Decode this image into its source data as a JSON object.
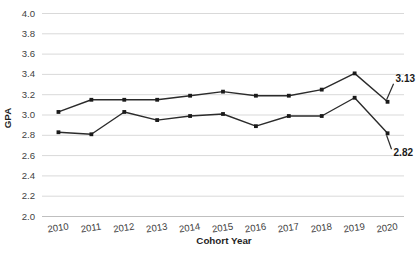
{
  "chart_data": {
    "type": "line",
    "title": "",
    "xlabel": "Cohort Year",
    "ylabel": "GPA",
    "categories": [
      "2010",
      "2011",
      "2012",
      "2013",
      "2014",
      "2015",
      "2016",
      "2017",
      "2018",
      "2019",
      "2020"
    ],
    "ylim": [
      2.0,
      4.0
    ],
    "ytick_labels": [
      "4.0",
      "3.8",
      "3.6",
      "3.4",
      "3.2",
      "3.0",
      "2.8",
      "2.6",
      "2.4",
      "2.2",
      "2.0"
    ],
    "ytick_values": [
      4.0,
      3.8,
      3.6,
      3.4,
      3.2,
      3.0,
      2.8,
      2.6,
      2.4,
      2.2,
      2.0
    ],
    "grid": true,
    "legend": "none",
    "series": [
      {
        "name": "upper-series",
        "values": [
          3.03,
          3.15,
          3.15,
          3.15,
          3.19,
          3.23,
          3.19,
          3.19,
          3.25,
          3.41,
          3.13
        ]
      },
      {
        "name": "lower-series",
        "values": [
          2.83,
          2.81,
          3.03,
          2.95,
          2.99,
          3.01,
          2.89,
          2.99,
          2.99,
          3.17,
          2.82
        ]
      }
    ],
    "annotations": [
      {
        "name": "upper-endpoint-label",
        "text": "3.13",
        "series": 0,
        "category": "2020",
        "value": 3.13
      },
      {
        "name": "lower-endpoint-label",
        "text": "2.82",
        "series": 1,
        "category": "2020",
        "value": 2.82
      }
    ],
    "colors": {
      "series_line": "#2b2b2b",
      "marker": "#1a1a1a",
      "gridline": "#d9d9d9",
      "tick_text": "#3f3f3f",
      "axis_title": "#1f1f1f",
      "background": "#ffffff"
    }
  }
}
